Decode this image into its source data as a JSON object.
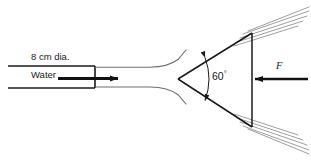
{
  "figure": {
    "kind": "fluid-mechanics-jet-on-cone-diagram",
    "background_color": "#ffffff",
    "line_color": "#1a1a1a",
    "spray_color": "#8d8d8d",
    "jet_outline_color": "#6e6e6e"
  },
  "labels": {
    "pipe_diameter": "8 cm dia.",
    "fluid": "Water",
    "cone_angle": "60",
    "degree_symbol": "°",
    "force": "F"
  },
  "geometry": {
    "pipe": {
      "top_wall_y": 66,
      "bottom_wall_y": 88,
      "left_x": 8,
      "end_cap_x": 95
    },
    "flow_arrow": {
      "x_start": 58,
      "x_end": 120,
      "y": 78,
      "direction": "right"
    },
    "cone": {
      "apex_x": 178,
      "apex_y": 79,
      "back_face_x": 252,
      "top_y": 33,
      "bottom_y": 127,
      "apex_angle_deg": 60
    },
    "force_arrow": {
      "x_start": 308,
      "x_end": 253,
      "y": 79,
      "direction": "left"
    },
    "spray_streams": {
      "upper_count": 5,
      "lower_count": 5
    }
  }
}
